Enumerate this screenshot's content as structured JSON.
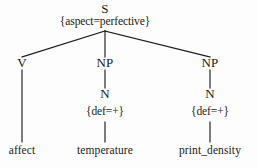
{
  "figure": {
    "type": "syntax-tree",
    "ink_color": "#1a1a1a",
    "background_color": "#fdfdfd"
  },
  "tree": {
    "root": {
      "category": "S",
      "features": "{aspect=perfective}"
    },
    "children": [
      {
        "category": "V",
        "features": "",
        "leaf": "affect",
        "daughters": []
      },
      {
        "category": "NP",
        "features": "",
        "daughters": [
          {
            "category": "N",
            "features": "{def=+}",
            "leaf": "temperature"
          }
        ]
      },
      {
        "category": "NP",
        "features": "",
        "daughters": [
          {
            "category": "N",
            "features": "{def=+}",
            "leaf": "print_density"
          }
        ]
      }
    ]
  },
  "labels": {
    "root_category": "S",
    "root_features": "{aspect=perfective}",
    "v_category": "V",
    "np1_category": "NP",
    "np2_category": "NP",
    "n1_category": "N",
    "n1_features": "{def=+}",
    "n2_category": "N",
    "n2_features": "{def=+}",
    "leaf_v": "affect",
    "leaf_n1": "temperature",
    "leaf_n2": "print_density"
  }
}
